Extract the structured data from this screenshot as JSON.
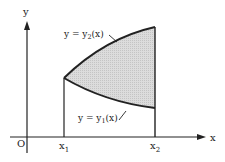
{
  "diagram": {
    "axes": {
      "x_label": "x",
      "y_label": "y",
      "origin_label": "O"
    },
    "ticks": {
      "x1": {
        "base": "x",
        "sub": "1"
      },
      "x2": {
        "base": "x",
        "sub": "2"
      }
    },
    "curves": {
      "upper": {
        "prefix": "y = y",
        "sub": "2",
        "suffix": "(x)"
      },
      "lower": {
        "prefix": "y = y",
        "sub": "1",
        "suffix": "(x)"
      }
    },
    "colors": {
      "line": "#222222",
      "fill": "#d6d6d6"
    }
  }
}
